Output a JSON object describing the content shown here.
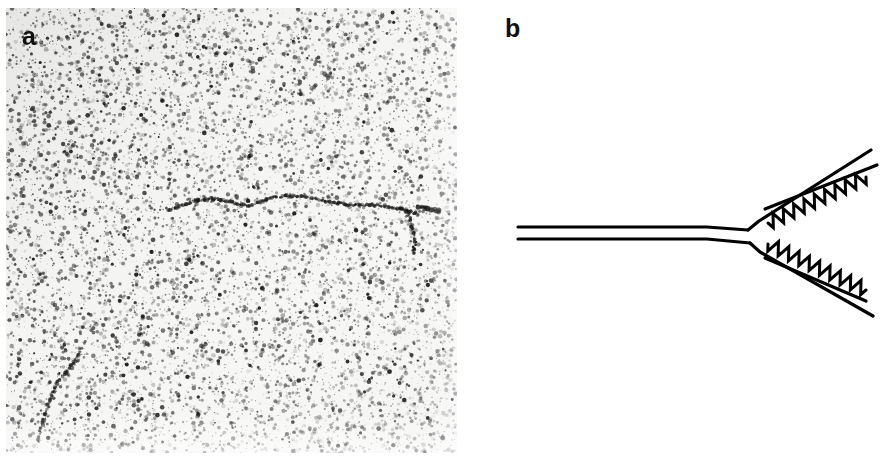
{
  "figure": {
    "width": 882,
    "height": 467,
    "background_color": "#ffffff",
    "kind": "two-panel scientific figure: electron micrograph plus line schematic"
  },
  "panels": [
    {
      "id": "a",
      "label": "a",
      "type": "electron-micrograph",
      "label_color": "#101010",
      "frame": {
        "x": 6,
        "y": 8,
        "width": 451,
        "height": 445
      },
      "background_color": "#f7f7f6",
      "grain": {
        "description": "dense fine dark speckle of heavy-metal stain grains over pale grey background",
        "dot_count": 9000,
        "dot_color": "#2b2b2b",
        "min_radius": 0.5,
        "max_radius": 2.3,
        "seed": 20250817
      },
      "features": [
        {
          "name": "dna-main-filament",
          "description": "long curved dark nucleic-acid molecule running left-to-right across the upper middle of the field",
          "points": [
            [
              168,
              210
            ],
            [
              182,
              205
            ],
            [
              196,
              201
            ],
            [
              212,
              199
            ],
            [
              228,
              201
            ],
            [
              244,
              205
            ],
            [
              258,
              203
            ],
            [
              272,
              198
            ],
            [
              288,
              196
            ],
            [
              304,
              197
            ],
            [
              320,
              200
            ],
            [
              336,
              203
            ],
            [
              352,
              205
            ],
            [
              368,
              205
            ],
            [
              384,
              206
            ],
            [
              398,
              208
            ],
            [
              410,
              212
            ],
            [
              418,
              214
            ]
          ]
        },
        {
          "name": "dna-branch-filament",
          "description": "short branch descending from the right end of the main filament",
          "points": [
            [
              406,
              210
            ],
            [
              410,
              220
            ],
            [
              414,
              232
            ],
            [
              415,
              244
            ],
            [
              413,
              254
            ]
          ]
        },
        {
          "name": "dna-right-cluster",
          "description": "dense stained cluster at the extreme right end of the main filament",
          "points": [
            [
              418,
              206
            ],
            [
              426,
              208
            ],
            [
              434,
              210
            ],
            [
              440,
              212
            ]
          ]
        },
        {
          "name": "dna-secondary-fragment",
          "description": "second shorter curved molecule in the lower-left quadrant",
          "points": [
            [
              80,
              352
            ],
            [
              74,
              362
            ],
            [
              66,
              372
            ],
            [
              58,
              382
            ],
            [
              52,
              394
            ],
            [
              48,
              406
            ],
            [
              44,
              418
            ],
            [
              40,
              430
            ],
            [
              38,
              442
            ]
          ]
        }
      ]
    },
    {
      "id": "b",
      "label": "b",
      "type": "line-schematic",
      "label_color": "#101010",
      "frame": {
        "x": 457,
        "y": 0,
        "width": 425,
        "height": 467
      },
      "background_color": "#ffffff",
      "line_color": "#000000",
      "description": "Y-shaped branched-DNA interpretive drawing: a double-stranded stem on the left splitting into two arms on the right; each arm carries a zigzag strand on its inner face",
      "elements": [
        {
          "name": "stem-strand-top",
          "kind": "smooth-line",
          "stroke_width": 3.2,
          "points": [
            [
              61,
              227
            ],
            [
              250,
              227
            ],
            [
              291,
              230
            ]
          ]
        },
        {
          "name": "stem-strand-bottom",
          "kind": "smooth-line",
          "stroke_width": 3.2,
          "points": [
            [
              61,
              239
            ],
            [
              250,
              239
            ],
            [
              293,
              243
            ]
          ]
        },
        {
          "name": "upper-arm-outer-strand",
          "kind": "smooth-line",
          "stroke_width": 3.2,
          "points": [
            [
              291,
              230
            ],
            [
              302,
              221
            ],
            [
              414,
              150
            ]
          ]
        },
        {
          "name": "upper-arm-inner-strand",
          "kind": "smooth-line",
          "stroke_width": 3.2,
          "points": [
            [
              308,
              209
            ],
            [
              420,
              165
            ]
          ]
        },
        {
          "name": "upper-arm-zigzag-strand",
          "kind": "zigzag-line",
          "stroke_width": 3.0,
          "amplitude": 6.5,
          "period": 5.6,
          "points": [
            [
              311,
              223
            ],
            [
              409,
              177
            ]
          ]
        },
        {
          "name": "lower-arm-outer-strand",
          "kind": "smooth-line",
          "stroke_width": 3.2,
          "points": [
            [
              293,
              243
            ],
            [
              303,
              252
            ],
            [
              416,
              316
            ]
          ]
        },
        {
          "name": "lower-arm-inner-strand",
          "kind": "smooth-line",
          "stroke_width": 3.2,
          "points": [
            [
              308,
              258
            ],
            [
              409,
              301
            ]
          ]
        },
        {
          "name": "lower-arm-zigzag-strand",
          "kind": "zigzag-line",
          "stroke_width": 3.0,
          "amplitude": 6.5,
          "period": 5.6,
          "points": [
            [
              311,
              244
            ],
            [
              409,
              290
            ]
          ]
        }
      ]
    }
  ]
}
